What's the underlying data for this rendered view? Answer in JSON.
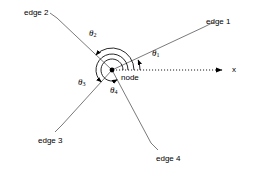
{
  "figure": {
    "background_color": "#ffffff",
    "line_color": "#555555",
    "text_color": "#000000",
    "arc_color": "#000000"
  },
  "node": {
    "label": "node",
    "x": 112,
    "y": 70
  },
  "axis": {
    "label": "x",
    "style": "dotted",
    "from": [
      112,
      70
    ],
    "to": [
      228,
      70
    ]
  },
  "edges": [
    {
      "id": "edge1",
      "label": "edge 1",
      "label_x": 206,
      "label_y": 18,
      "tip": [
        204,
        27
      ],
      "angle_deg": 21
    },
    {
      "id": "edge2",
      "label": "edge 2",
      "label_x": 24,
      "label_y": 9,
      "tip": [
        57,
        18
      ],
      "angle_deg": 137
    },
    {
      "id": "edge3",
      "label": "edge 3",
      "label_x": 38,
      "label_y": 137,
      "tip": [
        62,
        125
      ],
      "angle_deg": 228
    },
    {
      "id": "edge4",
      "label": "edge 4",
      "label_x": 156,
      "label_y": 155,
      "tip": [
        151,
        143
      ],
      "angle_deg": 298
    }
  ],
  "angles": [
    {
      "id": "theta1",
      "symbol": "θ",
      "sub": "1",
      "label_x": 152,
      "label_y": 53,
      "radius": 28,
      "end_deg": 21
    },
    {
      "id": "theta2",
      "symbol": "θ",
      "sub": "2",
      "label_x": 90,
      "label_y": 32,
      "radius": 22,
      "end_deg": 137
    },
    {
      "id": "theta3",
      "symbol": "θ",
      "sub": "3",
      "label_x": 78,
      "label_y": 81,
      "radius": 16,
      "end_deg": 228
    },
    {
      "id": "theta4",
      "symbol": "θ",
      "sub": "4",
      "label_x": 110,
      "label_y": 89,
      "radius": 11,
      "end_deg": 298
    }
  ]
}
